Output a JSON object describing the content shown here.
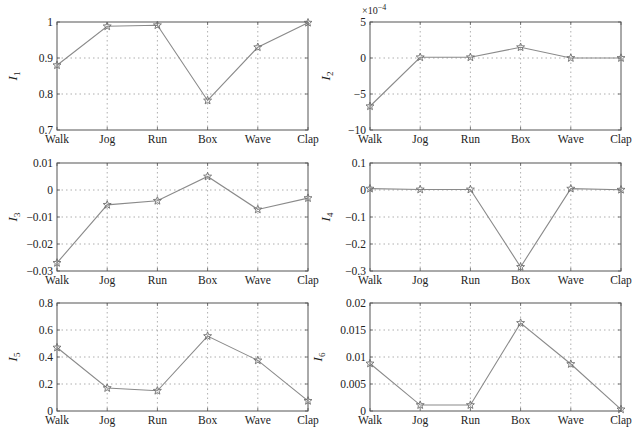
{
  "figure": {
    "width": 638,
    "height": 434,
    "colors": {
      "axis": "#555555",
      "grid": "#9a9a9a",
      "line": "#8a8a8a",
      "marker": "#6e6e6e",
      "text": "#222222"
    }
  },
  "chart_data": [
    {
      "id": "I1",
      "type": "line",
      "title": "",
      "xlabel": "",
      "ylabel": "I",
      "ylabel_subscript": "1",
      "categories": [
        "Walk",
        "Jog",
        "Run",
        "Box",
        "Wave",
        "Clap"
      ],
      "values": [
        0.88,
        0.988,
        0.991,
        0.782,
        0.93,
        0.998
      ],
      "ylim": [
        0.7,
        1.0
      ],
      "yticks": [
        0.7,
        0.8,
        0.9,
        1.0
      ],
      "ytick_labels": [
        "0.7",
        "0.8",
        "0.9",
        "1"
      ],
      "exponent_label": "",
      "grid": true,
      "marker": "star",
      "plot_box": {
        "x": 57,
        "y": 22,
        "w": 251,
        "h": 108
      }
    },
    {
      "id": "I2",
      "type": "line",
      "title": "",
      "xlabel": "",
      "ylabel": "I",
      "ylabel_subscript": "2",
      "categories": [
        "Walk",
        "Jog",
        "Run",
        "Box",
        "Wave",
        "Clap"
      ],
      "values": [
        -0.00067,
        1e-05,
        1e-05,
        0.00015,
        0.0,
        0.0
      ],
      "values_scaled": [
        -6.7,
        0.1,
        0.1,
        1.5,
        0.0,
        0.0
      ],
      "ylim": [
        -10,
        5
      ],
      "yticks": [
        -10,
        -5,
        0,
        5
      ],
      "ytick_labels": [
        "−10",
        "−5",
        "0",
        "5"
      ],
      "exponent_label": "×10",
      "exponent_power": "−4",
      "grid": true,
      "marker": "star",
      "plot_box": {
        "x": 370,
        "y": 22,
        "w": 251,
        "h": 108
      }
    },
    {
      "id": "I3",
      "type": "line",
      "title": "",
      "xlabel": "",
      "ylabel": "I",
      "ylabel_subscript": "3",
      "categories": [
        "Walk",
        "Jog",
        "Run",
        "Box",
        "Wave",
        "Clap"
      ],
      "values": [
        -0.027,
        -0.0055,
        -0.004,
        0.005,
        -0.0072,
        -0.003
      ],
      "ylim": [
        -0.03,
        0.01
      ],
      "yticks": [
        -0.03,
        -0.02,
        -0.01,
        0,
        0.01
      ],
      "ytick_labels": [
        "−0.03",
        "−0.02",
        "−0.01",
        "0",
        "0.01"
      ],
      "exponent_label": "",
      "grid": true,
      "marker": "star",
      "plot_box": {
        "x": 57,
        "y": 163,
        "w": 251,
        "h": 108
      }
    },
    {
      "id": "I4",
      "type": "line",
      "title": "",
      "xlabel": "",
      "ylabel": "I",
      "ylabel_subscript": "4",
      "categories": [
        "Walk",
        "Jog",
        "Run",
        "Box",
        "Wave",
        "Clap"
      ],
      "values": [
        0.005,
        0.002,
        0.002,
        -0.285,
        0.005,
        0.001
      ],
      "ylim": [
        -0.3,
        0.1
      ],
      "yticks": [
        -0.3,
        -0.2,
        -0.1,
        0,
        0.1
      ],
      "ytick_labels": [
        "−0.3",
        "−0.2",
        "−0.1",
        "0",
        "0.1"
      ],
      "exponent_label": "",
      "grid": true,
      "marker": "star",
      "plot_box": {
        "x": 370,
        "y": 163,
        "w": 251,
        "h": 108
      }
    },
    {
      "id": "I5",
      "type": "line",
      "title": "",
      "xlabel": "",
      "ylabel": "I",
      "ylabel_subscript": "5",
      "categories": [
        "Walk",
        "Jog",
        "Run",
        "Box",
        "Wave",
        "Clap"
      ],
      "values": [
        0.47,
        0.17,
        0.15,
        0.555,
        0.375,
        0.075
      ],
      "ylim": [
        0,
        0.8
      ],
      "yticks": [
        0,
        0.2,
        0.4,
        0.6,
        0.8
      ],
      "ytick_labels": [
        "0",
        "0.2",
        "0.4",
        "0.6",
        "0.8"
      ],
      "exponent_label": "",
      "grid": true,
      "marker": "star",
      "plot_box": {
        "x": 57,
        "y": 303,
        "w": 251,
        "h": 108
      }
    },
    {
      "id": "I6",
      "type": "line",
      "title": "",
      "xlabel": "",
      "ylabel": "I",
      "ylabel_subscript": "6",
      "categories": [
        "Walk",
        "Jog",
        "Run",
        "Box",
        "Wave",
        "Clap"
      ],
      "values": [
        0.0088,
        0.0011,
        0.0011,
        0.0163,
        0.0087,
        0.0003
      ],
      "ylim": [
        0,
        0.02
      ],
      "yticks": [
        0,
        0.005,
        0.01,
        0.015,
        0.02
      ],
      "ytick_labels": [
        "0",
        "0.005",
        "0.01",
        "0.015",
        "0.02"
      ],
      "exponent_label": "",
      "grid": true,
      "marker": "star",
      "plot_box": {
        "x": 370,
        "y": 303,
        "w": 251,
        "h": 108
      }
    }
  ]
}
